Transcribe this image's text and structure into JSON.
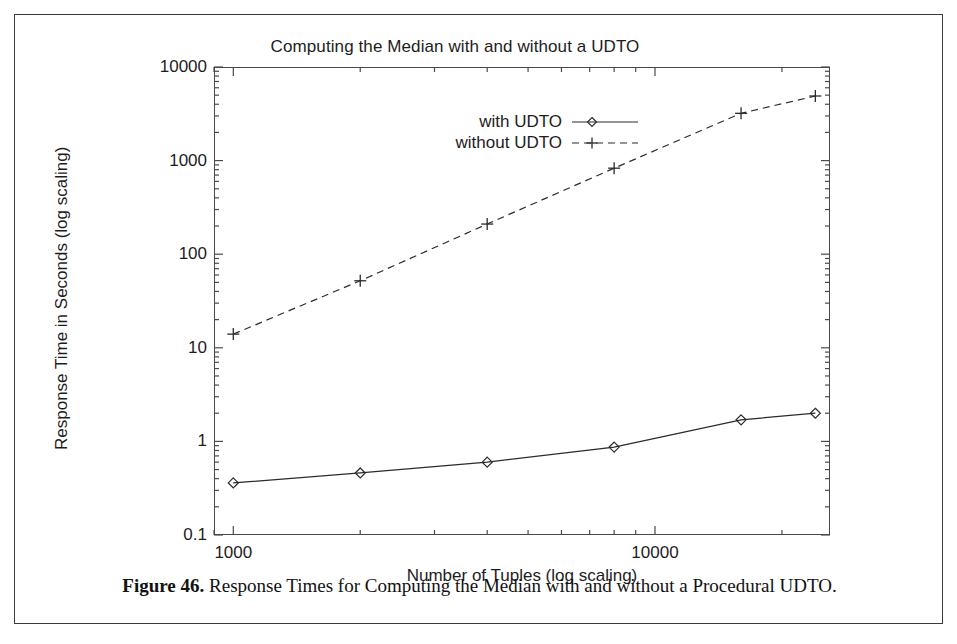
{
  "figure": {
    "caption_bold": "Figure 46.",
    "caption_text": " Response Times for Computing the Median with and without a Procedural UDTO."
  },
  "chart_data": {
    "type": "line",
    "title": "Computing the Median with and without a UDTO",
    "xlabel": "Number of Tuples (log scaling)",
    "ylabel": "Response Time in Seconds (log scaling)",
    "xscale": "log",
    "yscale": "log",
    "xlim": [
      900,
      26000
    ],
    "ylim": [
      0.1,
      10000
    ],
    "grid": false,
    "legend_position": "upper center",
    "x_tick_labels": [
      "1000",
      "10000"
    ],
    "x_ticks": [
      1000,
      10000
    ],
    "y_tick_labels": [
      "10000",
      "1000",
      "100",
      "10",
      "1",
      "0.1"
    ],
    "y_ticks": [
      10000,
      1000,
      100,
      10,
      1,
      0.1
    ],
    "x": [
      1000,
      2000,
      4000,
      8000,
      16000,
      24000
    ],
    "series": [
      {
        "name": "with UDTO",
        "marker": "diamond",
        "linestyle": "solid",
        "color": "#2b2b2b",
        "values": [
          0.36,
          0.46,
          0.6,
          0.87,
          1.7,
          2.0
        ]
      },
      {
        "name": "without UDTO",
        "marker": "plus",
        "linestyle": "dashed",
        "color": "#2b2b2b",
        "values": [
          14,
          52,
          210,
          830,
          3200,
          4900
        ]
      }
    ]
  }
}
